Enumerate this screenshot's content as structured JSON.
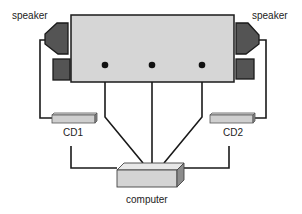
{
  "diagram": {
    "type": "connection-diagram",
    "labels": {
      "speaker_left": "speaker",
      "speaker_right": "speaker",
      "cd1": "CD1",
      "cd2": "CD2",
      "computer": "computer"
    },
    "colors": {
      "main_box_fill": "#d6d6d6",
      "speaker_fill": "#545454",
      "wire": "#1a1a1a",
      "drive_fill": "#d0d0d0",
      "computer_fill": "#d4d4d4"
    },
    "nodes": [
      {
        "id": "main-unit",
        "label": ""
      },
      {
        "id": "speaker-left",
        "label": "speaker"
      },
      {
        "id": "speaker-right",
        "label": "speaker"
      },
      {
        "id": "cd1",
        "label": "CD1"
      },
      {
        "id": "cd2",
        "label": "CD2"
      },
      {
        "id": "computer",
        "label": "computer"
      }
    ],
    "edges": [
      {
        "from": "speaker-left",
        "to": "cd1"
      },
      {
        "from": "speaker-right",
        "to": "cd2"
      },
      {
        "from": "main-unit",
        "to": "computer",
        "port": 1
      },
      {
        "from": "main-unit",
        "to": "computer",
        "port": 2
      },
      {
        "from": "main-unit",
        "to": "computer",
        "port": 3
      },
      {
        "from": "cd1",
        "to": "computer"
      },
      {
        "from": "cd2",
        "to": "computer"
      }
    ]
  }
}
